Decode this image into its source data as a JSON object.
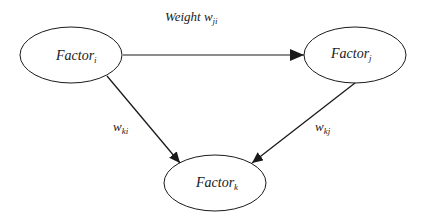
{
  "diagram": {
    "type": "directed-graph",
    "colors": {
      "stroke": "#1a1a1a",
      "background": "#ffffff"
    },
    "nodes": [
      {
        "id": "i",
        "label": "Factor",
        "subscript": "i",
        "cx": 71,
        "cy": 55,
        "rx": 51,
        "ry": 28
      },
      {
        "id": "j",
        "label": "Factor",
        "subscript": "j",
        "cx": 355,
        "cy": 55,
        "rx": 51,
        "ry": 28
      },
      {
        "id": "k",
        "label": "Factor",
        "subscript": "k",
        "cx": 215,
        "cy": 183,
        "rx": 51,
        "ry": 28
      }
    ],
    "edges": [
      {
        "from": "i",
        "to": "j",
        "label": "Weight w",
        "label_subscript": "ji"
      },
      {
        "from": "i",
        "to": "k",
        "label": "w",
        "label_subscript": "ki"
      },
      {
        "from": "j",
        "to": "k",
        "label": "w",
        "label_subscript": "kj"
      }
    ]
  }
}
